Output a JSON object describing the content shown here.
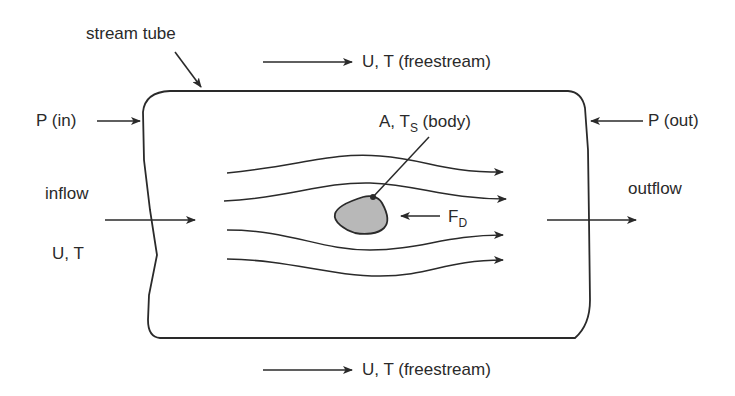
{
  "diagram": {
    "labels": {
      "stream_tube": "stream tube",
      "freestream_top": "U, T (freestream)",
      "freestream_bottom": "U, T (freestream)",
      "p_in": "P (in)",
      "p_out": "P (out)",
      "inflow": "inflow",
      "inflow_state": "U, T",
      "outflow": "outflow",
      "body_main": "A, T",
      "body_sub": "S",
      "body_suffix": " (body)",
      "drag_main": "F",
      "drag_sub": "D"
    },
    "colors": {
      "line": "#2a2a2a",
      "body_fill": "#b8b8b8",
      "background": "#ffffff"
    }
  }
}
